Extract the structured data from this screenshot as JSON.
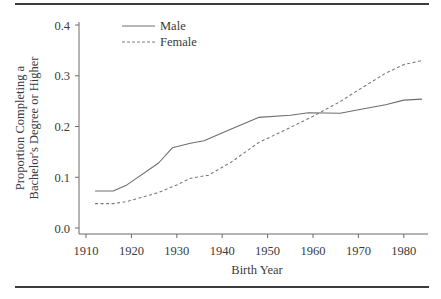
{
  "chart_data": {
    "type": "line",
    "title": "",
    "xlabel": "Birth Year",
    "ylabel": "Proportion Completing a Bachelor's Degree or Higher",
    "ylabel_lines": [
      "Proportion Completing a",
      "Bachelor's Degree or Higher"
    ],
    "xlim": [
      1908,
      1985
    ],
    "ylim": [
      0.0,
      0.4
    ],
    "xticks": [
      1910,
      1920,
      1930,
      1940,
      1950,
      1960,
      1970,
      1980
    ],
    "yticks": [
      0.0,
      0.1,
      0.2,
      0.3,
      0.4
    ],
    "ytick_labels": [
      "0.0",
      "0.1",
      "0.2",
      "0.3",
      "0.4"
    ],
    "grid": false,
    "legend_position": "upper left",
    "series": [
      {
        "name": "Male",
        "style": "solid",
        "color": "#6e6e6e",
        "x": [
          1912,
          1916,
          1919,
          1926,
          1929,
          1933,
          1936,
          1942,
          1948,
          1955,
          1959,
          1966,
          1970,
          1976,
          1980,
          1984
        ],
        "values": [
          0.073,
          0.073,
          0.085,
          0.128,
          0.158,
          0.167,
          0.172,
          0.195,
          0.218,
          0.222,
          0.227,
          0.226,
          0.233,
          0.243,
          0.252,
          0.254
        ]
      },
      {
        "name": "Female",
        "style": "dashed",
        "color": "#7a7a7a",
        "x": [
          1912,
          1916,
          1919,
          1926,
          1930,
          1933,
          1937,
          1942,
          1948,
          1955,
          1960,
          1966,
          1970,
          1976,
          1980,
          1984
        ],
        "values": [
          0.048,
          0.048,
          0.052,
          0.07,
          0.085,
          0.098,
          0.104,
          0.13,
          0.168,
          0.198,
          0.22,
          0.249,
          0.272,
          0.305,
          0.322,
          0.33
        ]
      }
    ]
  },
  "legend": {
    "items": [
      {
        "label": "Male",
        "style": "solid"
      },
      {
        "label": "Female",
        "style": "dashed"
      }
    ]
  }
}
